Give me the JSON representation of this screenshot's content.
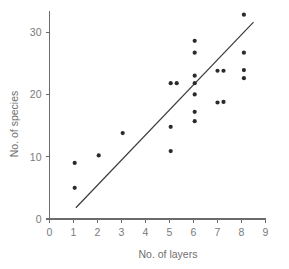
{
  "chart_data": {
    "type": "scatter",
    "title": "",
    "xlabel": "No. of layers",
    "ylabel": "No. of species",
    "xlim": [
      0,
      9
    ],
    "ylim": [
      0,
      33
    ],
    "grid": false,
    "legend": null,
    "x_ticks": [
      0,
      1,
      2,
      3,
      4,
      5,
      6,
      7,
      8,
      9
    ],
    "x_tick_labels": [
      "0",
      "1",
      "2",
      "3",
      "4",
      "5",
      "6",
      "7",
      "8",
      "9"
    ],
    "y_ticks": [
      0,
      10,
      20,
      30
    ],
    "y_tick_labels": [
      "0",
      "10",
      "20",
      "30"
    ],
    "points": [
      {
        "x": 1.05,
        "y": 9.0
      },
      {
        "x": 1.05,
        "y": 5.0
      },
      {
        "x": 2.05,
        "y": 10.2
      },
      {
        "x": 3.05,
        "y": 13.8
      },
      {
        "x": 5.05,
        "y": 21.8
      },
      {
        "x": 5.3,
        "y": 21.8
      },
      {
        "x": 5.05,
        "y": 14.8
      },
      {
        "x": 5.05,
        "y": 10.9
      },
      {
        "x": 6.05,
        "y": 28.6
      },
      {
        "x": 6.05,
        "y": 26.7
      },
      {
        "x": 6.05,
        "y": 23.0
      },
      {
        "x": 6.05,
        "y": 21.8
      },
      {
        "x": 6.05,
        "y": 20.0
      },
      {
        "x": 6.05,
        "y": 17.2
      },
      {
        "x": 6.05,
        "y": 15.7
      },
      {
        "x": 7.0,
        "y": 23.8
      },
      {
        "x": 7.25,
        "y": 23.8
      },
      {
        "x": 7.0,
        "y": 18.7
      },
      {
        "x": 7.25,
        "y": 18.8
      },
      {
        "x": 8.1,
        "y": 32.8
      },
      {
        "x": 8.1,
        "y": 26.7
      },
      {
        "x": 8.1,
        "y": 23.9
      },
      {
        "x": 8.1,
        "y": 22.6
      }
    ],
    "trend_line": {
      "x_start": 1.1,
      "y_start": 1.8,
      "x_end": 8.5,
      "y_end": 31.6
    },
    "point_color": "#2b2b2b",
    "line_color": "#3a3a3a",
    "axis_color": "#6b6b6b",
    "label_color": "#7a7a7a",
    "background_color": "#ffffff"
  }
}
